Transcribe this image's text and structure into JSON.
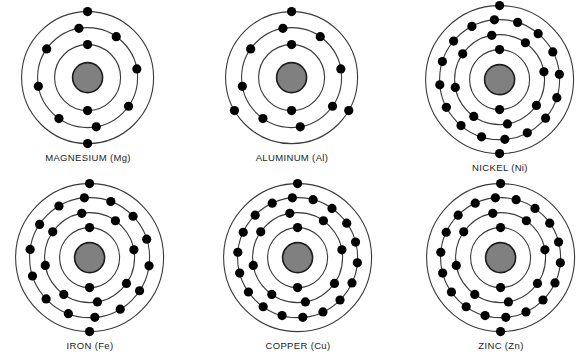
{
  "figure": {
    "background_color": "#ffffff",
    "nucleus_color": "#808080",
    "nucleus_border_color": "#1c1c1c",
    "electron_color": "#000000",
    "shell_color": "#3a3a3a",
    "label_color": "#1a1a1a",
    "rows": 2,
    "columns": 3
  },
  "atoms": [
    {
      "id": "magnesium",
      "label": "MAGNESIUM (Mg)",
      "element_name": "MAGNESIUM",
      "symbol": "Mg",
      "shell_count": 3,
      "electrons_per_shell": [
        2,
        8,
        2
      ],
      "total_electrons": 12,
      "shell_radii": [
        33,
        50,
        66
      ],
      "nucleus_radius": 15,
      "electron_radius": 4.6,
      "center": {
        "x": 88,
        "y": 78
      },
      "grid_position": {
        "row": 0,
        "col": 0
      },
      "shell_rotations": [
        90,
        100,
        90
      ]
    },
    {
      "id": "aluminum",
      "label": "ALUMINUM (Al)",
      "element_name": "ALUMINUM",
      "symbol": "Al",
      "shell_count": 3,
      "electrons_per_shell": [
        2,
        8,
        3
      ],
      "total_electrons": 13,
      "shell_radii": [
        33,
        50,
        66
      ],
      "nucleus_radius": 15,
      "electron_radius": 4.6,
      "center": {
        "x": 292,
        "y": 78
      },
      "grid_position": {
        "row": 0,
        "col": 1
      },
      "shell_rotations": [
        90,
        100,
        90
      ]
    },
    {
      "id": "nickel",
      "label": "NICKEL (Ni)",
      "element_name": "NICKEL",
      "symbol": "Ni",
      "shell_count": 4,
      "electrons_per_shell": [
        2,
        8,
        16,
        2
      ],
      "total_electrons": 28,
      "shell_radii": [
        30,
        45,
        60,
        74
      ],
      "nucleus_radius": 15,
      "electron_radius": 4.6,
      "center": {
        "x": 500,
        "y": 80
      },
      "grid_position": {
        "row": 0,
        "col": 2
      },
      "shell_rotations": [
        90,
        100,
        95,
        90
      ]
    },
    {
      "id": "iron",
      "label": "IRON (Fe)",
      "element_name": "IRON",
      "symbol": "Fe",
      "shell_count": 4,
      "electrons_per_shell": [
        2,
        8,
        14,
        2
      ],
      "total_electrons": 26,
      "shell_radii": [
        30,
        45,
        60,
        74
      ],
      "nucleus_radius": 15,
      "electron_radius": 4.6,
      "center": {
        "x": 90,
        "y": 258
      },
      "grid_position": {
        "row": 1,
        "col": 0
      },
      "shell_rotations": [
        90,
        100,
        95,
        90
      ]
    },
    {
      "id": "copper",
      "label": "COPPER (Cu)",
      "element_name": "COPPER",
      "symbol": "Cu",
      "shell_count": 4,
      "electrons_per_shell": [
        2,
        8,
        18,
        1
      ],
      "total_electrons": 29,
      "shell_radii": [
        30,
        45,
        60,
        74
      ],
      "nucleus_radius": 15,
      "electron_radius": 4.6,
      "center": {
        "x": 298,
        "y": 258
      },
      "grid_position": {
        "row": 1,
        "col": 1
      },
      "shell_rotations": [
        90,
        100,
        95,
        90
      ]
    },
    {
      "id": "zinc",
      "label": "ZINC (Zn)",
      "element_name": "ZINC",
      "symbol": "Zn",
      "shell_count": 4,
      "electrons_per_shell": [
        2,
        8,
        18,
        2
      ],
      "total_electrons": 30,
      "shell_radii": [
        30,
        45,
        60,
        74
      ],
      "nucleus_radius": 15,
      "electron_radius": 4.6,
      "center": {
        "x": 501,
        "y": 258
      },
      "grid_position": {
        "row": 1,
        "col": 2
      },
      "shell_rotations": [
        90,
        100,
        95,
        90
      ]
    }
  ]
}
